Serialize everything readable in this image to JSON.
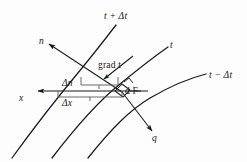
{
  "figure": {
    "kind": "line-diagram",
    "background_color": "#fdfdfd",
    "ink_color": "#1a1a1a"
  },
  "labels": {
    "isotherm_hot": "t + Δt",
    "isotherm_mid": "t",
    "isotherm_cold": "t − Δt",
    "normal": "n",
    "x_axis": "x",
    "heat_flux": "q",
    "gradient": "grad t",
    "delta_n": "Δn",
    "delta_x": "Δx",
    "area_element": "d F"
  },
  "curves": [
    {
      "name": "isotherm-t-plus-delta-t",
      "label": "t + Δt"
    },
    {
      "name": "isotherm-t",
      "label": "t"
    },
    {
      "name": "isotherm-t-minus-delta-t",
      "label": "t − Δt"
    }
  ],
  "vectors": [
    {
      "name": "normal-vector-n",
      "label": "n",
      "direction": "up-left"
    },
    {
      "name": "x-axis-vector",
      "label": "x",
      "direction": "left"
    },
    {
      "name": "gradient-vector",
      "label": "grad t",
      "direction": "up-left"
    },
    {
      "name": "heat-flux-vector-q",
      "label": "q",
      "direction": "down-right"
    }
  ],
  "measures": [
    {
      "name": "delta-n-brace",
      "label": "Δn"
    },
    {
      "name": "delta-x-brace",
      "label": "Δx"
    }
  ],
  "colors": {
    "ink": "#1a1a1a",
    "paper": "#fdfdfd"
  }
}
